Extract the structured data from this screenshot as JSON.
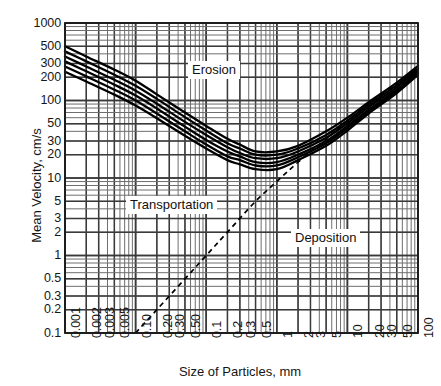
{
  "chart_data": {
    "type": "line",
    "title": "",
    "xlabel": "Size of Particles, mm",
    "ylabel": "Mean Velocity, cm/s",
    "xscale": "log",
    "yscale": "log",
    "xlim": [
      0.001,
      100
    ],
    "ylim": [
      0.1,
      1000
    ],
    "grid": true,
    "legend": "none",
    "x_tick_labels": [
      "0.001",
      "0.002",
      "0.003",
      "0.005",
      "0.10",
      "0.20",
      "0.30",
      "0.50",
      "0.1",
      "0.2",
      "0.3",
      "0.5",
      "1",
      "2",
      "3",
      "5",
      "10",
      "20",
      "30",
      "50",
      "100"
    ],
    "x_tick_values": [
      0.001,
      0.002,
      0.003,
      0.005,
      0.01,
      0.02,
      0.03,
      0.05,
      0.1,
      0.2,
      0.3,
      0.5,
      1,
      2,
      3,
      5,
      10,
      20,
      30,
      50,
      100
    ],
    "y_tick_labels": [
      "1000",
      "500",
      "300",
      "200",
      "100",
      "50",
      "30",
      "20",
      "10",
      "5",
      "3",
      "2",
      "1",
      "0.5",
      "0.3",
      "0.2",
      "0.1"
    ],
    "y_tick_values": [
      1000,
      500,
      300,
      200,
      100,
      50,
      30,
      20,
      10,
      5,
      3,
      2,
      1,
      0.5,
      0.3,
      0.2,
      0.1
    ],
    "annotations": [
      {
        "text": "Erosion",
        "x": 0.25,
        "y": 300
      },
      {
        "text": "Transportation",
        "x": 0.02,
        "y": 4
      },
      {
        "text": "Deposition",
        "x": 5,
        "y": 1.5
      }
    ],
    "series": [
      {
        "name": "critical-erosion-velocity-band-1",
        "style": "solid",
        "x": [
          0.001,
          0.002,
          0.005,
          0.01,
          0.02,
          0.05,
          0.1,
          0.2,
          0.3,
          0.5,
          1,
          2,
          5,
          10,
          20,
          50,
          100
        ],
        "y": [
          500,
          370,
          250,
          180,
          120,
          70,
          47,
          32,
          27,
          22,
          22,
          26,
          40,
          60,
          95,
          170,
          280
        ]
      },
      {
        "name": "critical-erosion-velocity-band-2",
        "style": "solid",
        "x": [
          0.001,
          0.002,
          0.005,
          0.01,
          0.02,
          0.05,
          0.1,
          0.2,
          0.3,
          0.5,
          1,
          2,
          5,
          10,
          20,
          50,
          100
        ],
        "y": [
          430,
          320,
          215,
          155,
          105,
          61,
          41,
          28,
          24,
          20,
          20,
          24,
          36,
          55,
          88,
          158,
          262
        ]
      },
      {
        "name": "critical-erosion-velocity-band-3",
        "style": "solid",
        "x": [
          0.001,
          0.002,
          0.005,
          0.01,
          0.02,
          0.05,
          0.1,
          0.2,
          0.3,
          0.5,
          1,
          2,
          5,
          10,
          20,
          50,
          100
        ],
        "y": [
          370,
          275,
          185,
          134,
          91,
          53,
          36,
          25,
          21,
          18,
          18,
          22,
          33,
          51,
          82,
          148,
          248
        ]
      },
      {
        "name": "critical-erosion-velocity-band-4",
        "style": "solid",
        "x": [
          0.001,
          0.002,
          0.005,
          0.01,
          0.02,
          0.05,
          0.1,
          0.2,
          0.3,
          0.5,
          1,
          2,
          5,
          10,
          20,
          50,
          100
        ],
        "y": [
          320,
          238,
          160,
          116,
          79,
          46,
          31,
          22,
          19,
          16,
          16,
          20,
          30,
          47,
          76,
          138,
          234
        ]
      },
      {
        "name": "critical-erosion-velocity-band-5",
        "style": "solid",
        "x": [
          0.001,
          0.002,
          0.005,
          0.01,
          0.02,
          0.05,
          0.1,
          0.2,
          0.3,
          0.5,
          1,
          2,
          5,
          10,
          20,
          50,
          100
        ],
        "y": [
          275,
          205,
          138,
          100,
          68,
          40,
          27,
          19,
          17,
          14.5,
          14.5,
          18.5,
          28,
          44,
          72,
          131,
          224
        ]
      },
      {
        "name": "critical-erosion-velocity-band-6",
        "style": "solid",
        "x": [
          0.001,
          0.002,
          0.005,
          0.01,
          0.02,
          0.05,
          0.1,
          0.2,
          0.3,
          0.5,
          1,
          2,
          5,
          10,
          20,
          50,
          100
        ],
        "y": [
          235,
          176,
          119,
          86,
          59,
          35,
          24,
          17,
          15,
          13,
          13,
          17,
          26,
          41,
          68,
          125,
          215
        ]
      },
      {
        "name": "critical-deposition-velocity",
        "style": "dashed",
        "x": [
          0.01,
          0.02,
          0.05,
          0.1,
          0.2,
          0.5,
          1,
          2,
          5,
          10,
          20,
          50,
          100
        ],
        "y": [
          0.1,
          0.2,
          0.5,
          1.0,
          2.0,
          5.0,
          9.0,
          16,
          32,
          55,
          90,
          160,
          235
        ]
      }
    ]
  },
  "axes": {
    "y_title": "Mean Velocity, cm/s",
    "x_title": "Size of Particles, mm"
  },
  "zones": {
    "erosion": "Erosion",
    "transportation": "Transportation",
    "deposition": "Deposition"
  },
  "colors": {
    "curve": "#000000",
    "grid_major": "#3a3a3a",
    "grid_minor": "#6e6e6e",
    "frame": "#1a1a1a",
    "text": "#161616",
    "background": "#ffffff"
  }
}
